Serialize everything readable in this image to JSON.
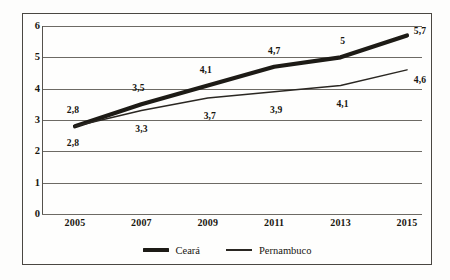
{
  "chart_data": {
    "type": "line",
    "title": "",
    "subtitle": "",
    "xlabel": "",
    "ylabel": "",
    "categories": [
      "2005",
      "2007",
      "2009",
      "2011",
      "2013",
      "2015"
    ],
    "x": [
      2005,
      2007,
      2009,
      2011,
      2013,
      2015
    ],
    "ylim": [
      0,
      6
    ],
    "xlim": [
      2005,
      2015
    ],
    "grid": true,
    "legend_position": "bottom-center",
    "ytick_labels": [
      "0",
      "1",
      "2",
      "3",
      "4",
      "5",
      "6"
    ],
    "ytick_values": [
      0,
      1,
      2,
      3,
      4,
      5,
      6
    ],
    "series": [
      {
        "name": "Ceará",
        "values": [
          2.8,
          3.5,
          4.1,
          4.7,
          5.0,
          5.7
        ],
        "value_labels": [
          "2,8",
          "3,5",
          "4,1",
          "4,7",
          "5",
          "5,7"
        ],
        "style": "thick",
        "color": "#1d1b16"
      },
      {
        "name": "Pernambuco",
        "values": [
          2.8,
          3.3,
          3.7,
          3.9,
          4.1,
          4.6
        ],
        "value_labels": [
          "2,8",
          "3,3",
          "3,7",
          "3,9",
          "4,1",
          "4,6"
        ],
        "style": "thin",
        "color": "#2a2722"
      }
    ]
  },
  "legend": {
    "items": [
      {
        "label": "Ceará",
        "marker": "thick-line-swatch"
      },
      {
        "label": "Pernambuco",
        "marker": "thin-line-swatch"
      }
    ]
  }
}
